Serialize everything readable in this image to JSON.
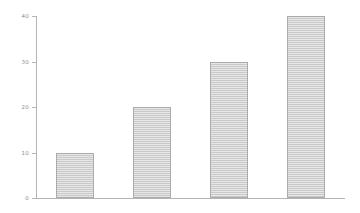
{
  "chart_data": {
    "type": "bar",
    "title": "",
    "subtitle": "",
    "xlabel": "",
    "ylabel": "",
    "categories": [
      "",
      "",
      "",
      ""
    ],
    "values": [
      10,
      20,
      30,
      40
    ],
    "ylim": [
      0,
      40
    ],
    "yticks": [
      0,
      10,
      20,
      30,
      40
    ],
    "ytick_labels": [
      "0",
      "10",
      "20",
      "30",
      "40"
    ],
    "xtick_labels": [],
    "grid": false,
    "legend": null,
    "annotations": [],
    "style": {
      "background": "#ffffff",
      "bar_fill": "#c9c9c9",
      "bar_edge": "#ababab",
      "axis_color": "#b4b4b4",
      "tick_label_color": "#8c8c8c"
    }
  }
}
